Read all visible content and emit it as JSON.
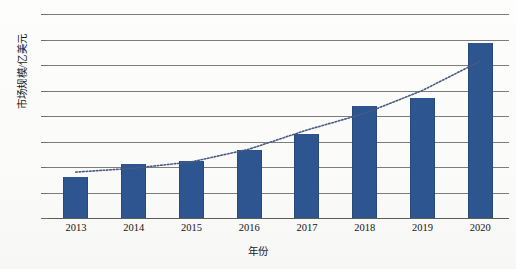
{
  "chart_data": {
    "type": "bar",
    "title": "",
    "xlabel": "年份",
    "ylabel": "市场规模/亿美元",
    "categories": [
      "2013",
      "2014",
      "2015",
      "2016",
      "2017",
      "2018",
      "2019",
      "2020"
    ],
    "values": [
      3.2,
      4.2,
      4.5,
      5.35,
      6.6,
      8.8,
      9.4,
      13.7
    ],
    "series": [
      {
        "name": "市场规模",
        "type": "bar",
        "values": [
          3.2,
          4.2,
          4.5,
          5.35,
          6.6,
          8.8,
          9.4,
          13.7
        ]
      },
      {
        "name": "趋势线",
        "type": "line",
        "style": "dotted",
        "values": [
          3.6,
          3.9,
          4.4,
          5.4,
          6.9,
          8.2,
          10.0,
          12.3
        ]
      }
    ],
    "ylim": [
      0,
      16
    ],
    "yticks": [
      0,
      2,
      4,
      6,
      8,
      10,
      12,
      14,
      16
    ],
    "ytick_labels": [
      "0",
      "2",
      "4",
      "6",
      "8",
      "10",
      "12",
      "14",
      "16"
    ],
    "grid": true,
    "legend": false,
    "legend_position": "none",
    "bar_color": "#2d5590",
    "grid_color": "#7d7d7d",
    "trend_color": "#4a5a80",
    "background": "#fefefe"
  }
}
